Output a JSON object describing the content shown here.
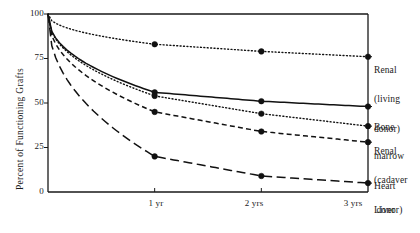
{
  "chart_data": {
    "type": "line",
    "title": "",
    "xlabel": "",
    "ylabel": "Percent of Functioning Grafts",
    "x": [
      0,
      1,
      2,
      3
    ],
    "xtick_labels": [
      "1 yr",
      "2 yrs",
      "3 yrs"
    ],
    "xtick_values": [
      1,
      2,
      3
    ],
    "ytick_labels": [
      "0",
      "25",
      "50",
      "75",
      "100"
    ],
    "ytick_values": [
      0,
      25,
      50,
      75,
      100
    ],
    "xlim": [
      0,
      3
    ],
    "ylim": [
      0,
      100
    ],
    "grid": false,
    "legend_position": "right-of-axes-inline",
    "markers": "filled-circle",
    "series": [
      {
        "name": "Renal (living donor)",
        "label_lines": [
          "Renal",
          "(living",
          "donor)"
        ],
        "style": "dotted",
        "color": "#111111",
        "values": [
          100,
          83,
          79,
          76
        ]
      },
      {
        "name": "Bone marrow",
        "label_lines": [
          "Bone",
          "marrow"
        ],
        "style": "solid",
        "color": "#111111",
        "values": [
          100,
          56,
          51,
          48
        ]
      },
      {
        "name": "Renal (cadaver donor)",
        "label_lines": [
          "Renal",
          "(cadaver",
          "donor)"
        ],
        "style": "dotted",
        "color": "#111111",
        "values": [
          100,
          54,
          44,
          37
        ]
      },
      {
        "name": "Heart",
        "label_lines": [
          "Heart"
        ],
        "style": "dashed",
        "color": "#111111",
        "values": [
          100,
          45,
          34,
          28
        ]
      },
      {
        "name": "Liver",
        "label_lines": [
          "Liver"
        ],
        "style": "long-dashed",
        "color": "#111111",
        "values": [
          100,
          20,
          9,
          5
        ]
      }
    ]
  },
  "axes": {
    "ylabel": "Percent of Functioning Grafts",
    "yticks": [
      {
        "label": "100",
        "value": 100
      },
      {
        "label": "75",
        "value": 75
      },
      {
        "label": "50",
        "value": 50
      },
      {
        "label": "25",
        "value": 25
      },
      {
        "label": "0",
        "value": 0
      }
    ],
    "xticks": [
      {
        "label": "1 yr",
        "value": 1
      },
      {
        "label": "2 yrs",
        "value": 2
      },
      {
        "label": "3 yrs",
        "value": 3
      }
    ]
  },
  "legend": {
    "entries": [
      {
        "line1": "Renal",
        "line2": "(living",
        "line3": "donor)"
      },
      {
        "line1": "Bone",
        "line2": "marrow",
        "line3": ""
      },
      {
        "line1": "Renal",
        "line2": "(cadaver",
        "line3": " donor)"
      },
      {
        "line1": "Heart",
        "line2": "",
        "line3": ""
      },
      {
        "line1": "Liver",
        "line2": "",
        "line3": ""
      }
    ]
  }
}
